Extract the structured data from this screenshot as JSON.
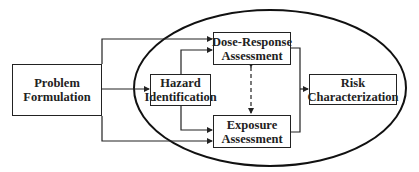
{
  "diagram": {
    "type": "flowchart",
    "nodes": {
      "problem_formulation": {
        "line1": "Problem",
        "line2": "Formulation"
      },
      "hazard_identification": {
        "line1": "Hazard",
        "line2": "Identification"
      },
      "dose_response": {
        "line1": "Dose-Response",
        "line2": "Assessment"
      },
      "exposure": {
        "line1": "Exposure",
        "line2": "Assessment"
      },
      "risk_characterization": {
        "line1": "Risk",
        "line2": "Characterization"
      }
    },
    "edges": [
      {
        "from": "Problem Formulation",
        "to": "Dose-Response Assessment",
        "style": "solid"
      },
      {
        "from": "Problem Formulation",
        "to": "Hazard Identification",
        "style": "solid"
      },
      {
        "from": "Problem Formulation",
        "to": "Exposure Assessment",
        "style": "solid"
      },
      {
        "from": "Hazard Identification",
        "to": "Dose-Response Assessment",
        "style": "solid"
      },
      {
        "from": "Hazard Identification",
        "to": "Exposure Assessment",
        "style": "solid"
      },
      {
        "from": "Dose-Response Assessment",
        "to": "Exposure Assessment",
        "style": "dashed-bidirectional"
      },
      {
        "from": "Dose-Response Assessment",
        "to": "Risk Characterization",
        "style": "solid"
      },
      {
        "from": "Exposure Assessment",
        "to": "Risk Characterization",
        "style": "solid"
      }
    ],
    "colors": {
      "stroke": "#222222",
      "background": "#ffffff"
    }
  }
}
